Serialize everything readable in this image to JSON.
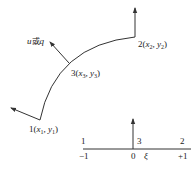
{
  "diagram": {
    "colors": {
      "line": "#333333",
      "text": "#222222",
      "background": "#ffffff"
    },
    "flux_label": {
      "var1": "u",
      "connector": "或",
      "var2": "q"
    },
    "nodes": [
      {
        "id": "1",
        "text": "1(",
        "x": "x",
        "xs": "1",
        "sep": ", ",
        "y": "y",
        "ys": "1",
        "close": ")"
      },
      {
        "id": "2",
        "text": "2(",
        "x": "x",
        "xs": "2",
        "sep": ", ",
        "y": "y",
        "ys": "2",
        "close": ")"
      },
      {
        "id": "3",
        "text": "3(",
        "x": "x",
        "xs": "3",
        "sep": ", ",
        "y": "y",
        "ys": "3",
        "close": ")"
      }
    ],
    "reference_element": {
      "node_labels": [
        "1",
        "3",
        "2"
      ],
      "tick_labels": [
        "−1",
        "0",
        "+1"
      ],
      "axis_label": "ξ"
    }
  }
}
